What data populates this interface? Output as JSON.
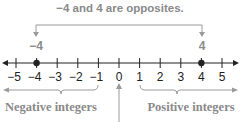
{
  "title": "−4 and 4 are opposites.",
  "opposites": {
    "left_label": "−4",
    "right_label": "4",
    "left_value": -4,
    "right_value": 4
  },
  "number_line": {
    "min": -5,
    "max": 5,
    "ticks": [
      {
        "value": -5,
        "label": "−5"
      },
      {
        "value": -4,
        "label": "−4"
      },
      {
        "value": -3,
        "label": "−3"
      },
      {
        "value": -2,
        "label": "−2"
      },
      {
        "value": -1,
        "label": "−1"
      },
      {
        "value": 0,
        "label": "0"
      },
      {
        "value": 1,
        "label": "1"
      },
      {
        "value": 2,
        "label": "2"
      },
      {
        "value": 3,
        "label": "3"
      },
      {
        "value": 4,
        "label": "4"
      },
      {
        "value": 5,
        "label": "5"
      }
    ],
    "highlighted_points": [
      -4,
      4
    ]
  },
  "categories": {
    "negative": "Negative integers",
    "positive": "Positive integers"
  },
  "colors": {
    "annotation": "#8a8a8a",
    "line": "#222222",
    "bracket": "#9a9a9a"
  }
}
